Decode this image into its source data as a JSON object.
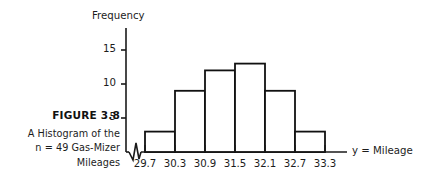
{
  "figure": {
    "number_label": "FIGURE 3.8",
    "caption_lines": [
      "A Histogram of the",
      "n = 49 Gas-Mizer",
      "Mileages"
    ]
  },
  "chart_data": {
    "type": "bar",
    "title": "",
    "subtitle": "",
    "xlabel": "y = Mileage",
    "ylabel": "Frequency",
    "categories": [
      "29.7-30.3",
      "30.3-30.9",
      "30.9-31.5",
      "31.5-32.1",
      "32.1-32.7",
      "32.7-33.3"
    ],
    "values": [
      3,
      9,
      12,
      13,
      9,
      3
    ],
    "bin_edges": [
      "29.7",
      "30.3",
      "30.9",
      "31.5",
      "32.1",
      "32.7",
      "33.3"
    ],
    "bin_width": 0.6,
    "total_n": 49,
    "ylim": [
      0,
      17
    ],
    "ytick_values": [
      5,
      10,
      15
    ],
    "ytick_labels": [
      "5",
      "10",
      "15"
    ],
    "xtick_labels": [
      "29.7",
      "30.3",
      "30.9",
      "31.5",
      "32.1",
      "32.7",
      "33.3"
    ],
    "grid": false,
    "legend": null,
    "axis_break": "zigzag-on-x-axis-near-origin",
    "colors": {
      "axis": "#1a1a1a",
      "bar_outline": "#111111",
      "bar_fill": "#ffffff",
      "background": "#ffffff",
      "text": "#1c1c1c"
    }
  }
}
